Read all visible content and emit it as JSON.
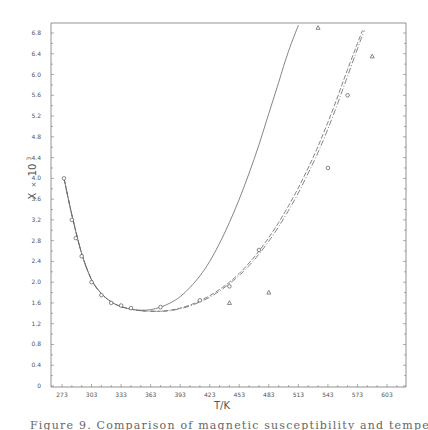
{
  "chart_data": {
    "type": "line",
    "title": "",
    "xlabel": "T/K",
    "ylabel": "X × 10³",
    "xlim": [
      263,
      620
    ],
    "ylim": [
      0,
      7.0
    ],
    "x_ticks": [
      273,
      303,
      333,
      363,
      393,
      423,
      453,
      483,
      513,
      543,
      573,
      603
    ],
    "y_ticks": [
      0,
      0.4,
      0.8,
      1.2,
      1.6,
      2.0,
      2.4,
      2.8,
      3.2,
      3.6,
      4.0,
      4.4,
      4.8,
      5.2,
      5.6,
      6.0,
      6.4,
      6.8
    ],
    "y_tick_labels": [
      "0",
      "0.4",
      "0.8",
      "1.2",
      "1.6",
      "2.0",
      "2.4",
      "2.8",
      "3.2",
      "3.6",
      "4.0",
      "4.4",
      "4.8",
      "5.2",
      "5.6",
      "6.0",
      "6.4",
      "6.8"
    ],
    "grid": false,
    "legend": null,
    "series": [
      {
        "name": "solid curve",
        "style": "solid",
        "x": [
          275,
          283,
          293,
          303,
          313,
          323,
          333,
          343,
          353,
          363,
          373,
          383,
          393,
          403,
          413,
          423,
          433,
          443,
          453,
          463,
          473,
          483,
          493,
          503,
          513
        ],
        "y": [
          4.0,
          3.3,
          2.55,
          2.05,
          1.78,
          1.62,
          1.53,
          1.48,
          1.46,
          1.47,
          1.52,
          1.6,
          1.72,
          1.9,
          2.12,
          2.4,
          2.75,
          3.15,
          3.6,
          4.1,
          4.65,
          5.25,
          5.85,
          6.45,
          6.95
        ]
      },
      {
        "name": "dashed curve",
        "style": "dashed",
        "x": [
          275,
          283,
          293,
          303,
          313,
          323,
          333,
          343,
          353,
          363,
          373,
          383,
          393,
          403,
          413,
          423,
          433,
          443,
          453,
          463,
          473,
          483,
          493,
          503,
          513,
          523,
          533,
          543,
          553,
          563,
          573,
          578
        ],
        "y": [
          4.0,
          3.3,
          2.55,
          2.05,
          1.78,
          1.62,
          1.53,
          1.48,
          1.45,
          1.44,
          1.44,
          1.46,
          1.5,
          1.56,
          1.64,
          1.74,
          1.86,
          2.0,
          2.17,
          2.37,
          2.6,
          2.86,
          3.15,
          3.47,
          3.82,
          4.2,
          4.62,
          5.08,
          5.58,
          6.1,
          6.6,
          6.85
        ]
      },
      {
        "name": "dash-dot curve",
        "style": "dashdot",
        "x": [
          275,
          283,
          293,
          303,
          313,
          323,
          333,
          343,
          353,
          363,
          373,
          383,
          393,
          403,
          413,
          423,
          433,
          443,
          453,
          463,
          473,
          483,
          493,
          503,
          513,
          523,
          533,
          543,
          553,
          563,
          573,
          580
        ],
        "y": [
          4.0,
          3.3,
          2.55,
          2.05,
          1.78,
          1.62,
          1.53,
          1.48,
          1.45,
          1.44,
          1.44,
          1.45,
          1.49,
          1.54,
          1.62,
          1.71,
          1.83,
          1.97,
          2.13,
          2.32,
          2.54,
          2.79,
          3.07,
          3.38,
          3.72,
          4.1,
          4.5,
          4.95,
          5.45,
          5.97,
          6.5,
          6.85
        ]
      },
      {
        "name": "circles (experimental)",
        "style": "marker-circle",
        "x": [
          275,
          283,
          287,
          293,
          303,
          313,
          323,
          333,
          343,
          373,
          413,
          443,
          473,
          543,
          563
        ],
        "y": [
          4.0,
          3.2,
          2.85,
          2.5,
          2.0,
          1.75,
          1.6,
          1.55,
          1.5,
          1.52,
          1.65,
          1.92,
          2.62,
          4.2,
          5.6
        ]
      },
      {
        "name": "triangles (experimental)",
        "style": "marker-triangle",
        "x": [
          443,
          483,
          533,
          588
        ],
        "y": [
          1.6,
          1.8,
          6.9,
          6.35
        ]
      }
    ]
  },
  "axes": {
    "xlabel": "T/K",
    "ylabel_main": "X",
    "ylabel_times": "×",
    "ylabel_ten": "10",
    "ylabel_exp": "3"
  },
  "caption": "Figure 9.  Comparison of magnetic susceptibility and temperature model"
}
